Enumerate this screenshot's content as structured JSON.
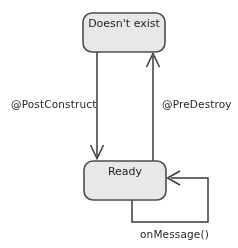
{
  "diagram": {
    "type": "state-machine",
    "background_color": "#ffffff",
    "state_fill_color": "#e8e8e8",
    "state_border_color": "#4d4d4d",
    "edge_color": "#3b3b3b",
    "text_color": "#1c1c1c",
    "states": [
      {
        "id": "does-not-exist",
        "label": "Doesn't exist",
        "x": 83,
        "y": 13,
        "width": 82,
        "height": 39
      },
      {
        "id": "ready",
        "label": "Ready",
        "x": 84,
        "y": 161,
        "width": 82,
        "height": 39
      }
    ],
    "transitions": [
      {
        "id": "post-construct",
        "label": "@PostConstruct",
        "from": "does-not-exist",
        "to": "ready",
        "direction": "down",
        "label_x": 11,
        "label_y": 108
      },
      {
        "id": "pre-destroy",
        "label": "@PreDestroy",
        "from": "ready",
        "to": "does-not-exist",
        "direction": "up",
        "label_x": 162,
        "label_y": 108
      },
      {
        "id": "on-message",
        "label": "onMessage()",
        "from": "ready",
        "to": "ready",
        "direction": "self-loop",
        "label_x": 140,
        "label_y": 238
      }
    ]
  }
}
